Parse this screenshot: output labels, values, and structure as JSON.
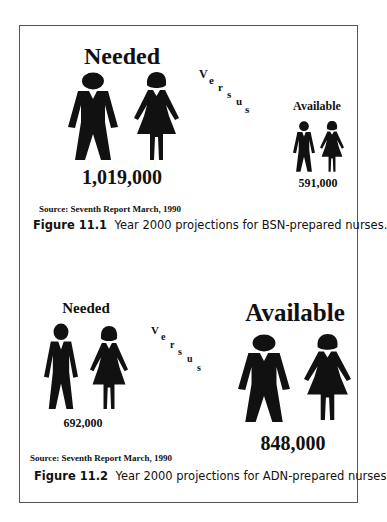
{
  "figures": [
    {
      "id": "11.1",
      "needed": {
        "label": "Needed",
        "value": "1,019,000"
      },
      "versus_letters": [
        "V",
        "e",
        "r",
        "s",
        "u",
        "s"
      ],
      "available": {
        "label": "Available",
        "value": "591,000"
      },
      "source": "Source:  Seventh Report March, 1990",
      "caption": {
        "label": "Figure 11.1",
        "text": "Year 2000 projections for BSN-prepared nurses."
      }
    },
    {
      "id": "11.2",
      "needed": {
        "label": "Needed",
        "value": "692,000"
      },
      "versus_letters": [
        "V",
        "e",
        "r",
        "s",
        "u",
        "s"
      ],
      "available": {
        "label": "Available",
        "value": "848,000"
      },
      "source": "Source:  Seventh Report March, 1990",
      "caption": {
        "label": "Figure 11.2",
        "text": "Year 2000 projections for ADN-prepared nurses"
      }
    }
  ],
  "icons": {
    "man": "man-silhouette-icon",
    "woman": "woman-silhouette-icon"
  },
  "colors": {
    "ink": "#111111",
    "border": "#555555",
    "background": "#ffffff"
  }
}
